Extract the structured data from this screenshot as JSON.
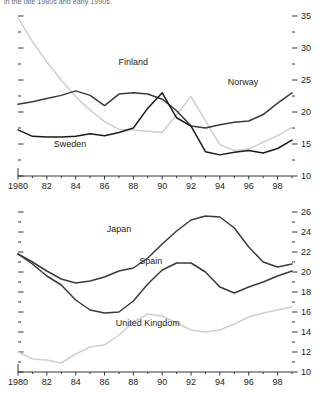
{
  "caption_fragment": "in the late 1980s and early 1990s.",
  "chart_data": [
    {
      "id": "top",
      "type": "line",
      "title": "",
      "xlabel": "",
      "ylabel": "",
      "x": [
        1980,
        1981,
        1982,
        1983,
        1984,
        1985,
        1986,
        1987,
        1988,
        1989,
        1990,
        1991,
        1992,
        1993,
        1994,
        1995,
        1996,
        1997,
        1998,
        1999
      ],
      "xticks": [
        1980,
        1982,
        1984,
        1986,
        1988,
        1990,
        1992,
        1994,
        1996,
        1998
      ],
      "xtick_labels": [
        "1980",
        "82",
        "84",
        "86",
        "88",
        "90",
        "92",
        "94",
        "96",
        "98"
      ],
      "xlim": [
        1980,
        1999
      ],
      "ylim": [
        10,
        35
      ],
      "yticks": [
        10,
        15,
        20,
        25,
        30,
        35
      ],
      "ytick_labels": [
        "10",
        "15",
        "20",
        "25",
        "30",
        "35"
      ],
      "yminor": [
        12.5,
        17.5,
        22.5,
        27.5,
        32.5
      ],
      "axis_side": "both",
      "grid": false,
      "legend": "inline-annotations",
      "series": [
        {
          "name": "Finland",
          "color": "#cfcfcf",
          "label_x": 1988.0,
          "label_y": 27.4,
          "values": [
            34.7,
            31.0,
            27.8,
            25.0,
            22.4,
            20.3,
            18.5,
            17.3,
            17.2,
            17.0,
            16.8,
            19.6,
            22.4,
            18.6,
            14.9,
            14.0,
            14.2,
            15.3,
            16.3,
            17.6
          ]
        },
        {
          "name": "Norway",
          "color": "#3a3a3a",
          "label_x": 1995.6,
          "label_y": 24.2,
          "values": [
            21.2,
            21.6,
            22.1,
            22.6,
            23.3,
            22.6,
            21.0,
            22.8,
            23.0,
            22.8,
            22.0,
            20.2,
            17.8,
            17.5,
            18.0,
            18.4,
            18.6,
            19.6,
            21.4,
            23.0
          ]
        },
        {
          "name": "Sweden",
          "color": "#1a1a1a",
          "label_x": 1983.6,
          "label_y": 14.6,
          "values": [
            17.2,
            16.2,
            16.1,
            16.1,
            16.2,
            16.6,
            16.3,
            16.8,
            17.5,
            20.6,
            23.0,
            19.1,
            17.8,
            13.8,
            13.3,
            13.7,
            14.0,
            13.6,
            14.3,
            15.6
          ]
        }
      ]
    },
    {
      "id": "bottom",
      "type": "line",
      "title": "",
      "xlabel": "",
      "ylabel": "",
      "x": [
        1980,
        1981,
        1982,
        1983,
        1984,
        1985,
        1986,
        1987,
        1988,
        1989,
        1990,
        1991,
        1992,
        1993,
        1994,
        1995,
        1996,
        1997,
        1998,
        1999
      ],
      "xticks": [
        1980,
        1982,
        1984,
        1986,
        1988,
        1990,
        1992,
        1994,
        1996,
        1998
      ],
      "xtick_labels": [
        "1980",
        "82",
        "84",
        "86",
        "88",
        "90",
        "92",
        "94",
        "96",
        "98"
      ],
      "xlim": [
        1980,
        1999
      ],
      "ylim": [
        10,
        26
      ],
      "yticks": [
        10,
        12,
        14,
        16,
        18,
        20,
        22,
        24,
        26
      ],
      "ytick_labels": [
        "10",
        "12",
        "14",
        "16",
        "18",
        "20",
        "22",
        "24",
        "26"
      ],
      "yminor": [
        11,
        13,
        15,
        17,
        19,
        21,
        23,
        25
      ],
      "axis_side": "both",
      "grid": false,
      "legend": "inline-annotations",
      "series": [
        {
          "name": "Japan",
          "color": "#3a3a3a",
          "label_x": 1987.0,
          "label_y": 24.0,
          "values": [
            21.8,
            21.0,
            20.1,
            19.3,
            18.9,
            19.1,
            19.5,
            20.1,
            20.4,
            21.4,
            22.8,
            24.1,
            25.2,
            25.6,
            25.5,
            24.4,
            22.5,
            21.0,
            20.5,
            20.8
          ]
        },
        {
          "name": "Spain",
          "color": "#3a3a3a",
          "label_x": 1989.2,
          "label_y": 20.8,
          "values": [
            21.8,
            20.8,
            19.6,
            18.7,
            17.2,
            16.2,
            15.9,
            16.0,
            17.1,
            18.8,
            20.2,
            20.9,
            20.9,
            20.0,
            18.5,
            17.9,
            18.5,
            19.0,
            19.6,
            20.1
          ]
        },
        {
          "name": "United Kingdom",
          "color": "#cfcfcf",
          "label_x": 1989.0,
          "label_y": 14.6,
          "values": [
            12.0,
            11.3,
            11.2,
            10.9,
            11.8,
            12.5,
            12.7,
            13.7,
            15.0,
            15.8,
            15.6,
            14.9,
            14.2,
            14.0,
            14.2,
            14.8,
            15.5,
            15.9,
            16.2,
            16.5
          ]
        }
      ]
    }
  ]
}
